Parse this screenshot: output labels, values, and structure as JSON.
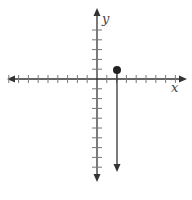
{
  "graph": {
    "x_label": "x",
    "y_label": "y",
    "x_ticks": [
      -9,
      -8,
      -7,
      -6,
      -5,
      -4,
      -3,
      -2,
      -1,
      1,
      2,
      3,
      4,
      5,
      6,
      7,
      8
    ],
    "y_ticks_above": [
      1,
      2,
      3,
      4,
      5
    ],
    "y_ticks_below": [
      -1,
      -2,
      -3,
      -4,
      -5,
      -6,
      -7,
      -8,
      -9
    ],
    "point": {
      "x": 2,
      "y": 1,
      "style": "closed"
    },
    "ray": {
      "from": [
        2,
        1
      ],
      "direction": "down"
    },
    "colors": {
      "stroke": "#333333",
      "tick": "#666666"
    }
  }
}
